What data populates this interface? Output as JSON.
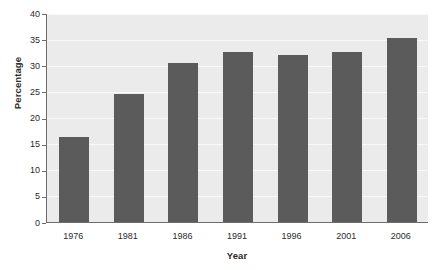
{
  "chart_data": {
    "type": "bar",
    "title": "",
    "xlabel": "Year",
    "ylabel": "Percentage",
    "categories": [
      "1976",
      "1981",
      "1986",
      "1991",
      "1996",
      "2001",
      "2006"
    ],
    "values": [
      16.2,
      24.5,
      30.5,
      32.5,
      32.0,
      32.6,
      35.3
    ],
    "series": [
      {
        "name": "Percentage",
        "values": [
          16.2,
          24.5,
          30.5,
          32.5,
          32.0,
          32.6,
          35.3
        ]
      }
    ],
    "ylim": [
      0,
      40
    ],
    "ytick_values": [
      0,
      5,
      10,
      15,
      20,
      25,
      30,
      35,
      40
    ],
    "ytick_labels": [
      "0",
      "5",
      "10",
      "15",
      "20",
      "25",
      "30",
      "35",
      "40"
    ],
    "grid": true,
    "grid_orientation": "horizontal",
    "legend": false,
    "legend_position": "none",
    "bar_color": "#5b5b5b",
    "plot_background": "#ebebeb",
    "axis_color": "#6d6d6d",
    "gridline_color": "#f9f9f9"
  }
}
